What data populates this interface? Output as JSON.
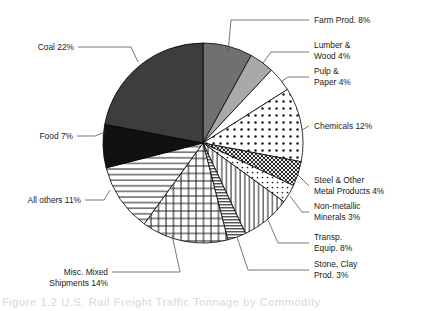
{
  "chart_data": {
    "type": "pie",
    "title": "",
    "xlabel": "",
    "ylabel": "",
    "legend_position": "callout-labels",
    "grid": false,
    "units": "percent",
    "total": 100,
    "categories": [
      "Farm Prod.",
      "Lumber & Wood",
      "Pulp & Paper",
      "Chemicals",
      "Steel & Other Metal Products",
      "Non-metallic Minerals",
      "Transp. Equip.",
      "Stone, Clay Prod.",
      "Misc. Mixed Shipments",
      "All others",
      "Food",
      "Coal"
    ],
    "values": [
      8,
      4,
      4,
      12,
      4,
      3,
      8,
      3,
      14,
      11,
      7,
      22
    ],
    "slices": [
      {
        "name": "farm-prod",
        "label_lines": [
          "Farm Prod. 8%"
        ],
        "value": 8,
        "percent_text": "8%",
        "fill": "#707070",
        "pattern": "solid",
        "start_angle": 0,
        "end_angle": 28.8
      },
      {
        "name": "lumber-wood",
        "label_lines": [
          "Lumber &",
          "Wood 4%"
        ],
        "value": 4,
        "percent_text": "4%",
        "fill": "#a9a9a9",
        "pattern": "solid",
        "start_angle": 28.8,
        "end_angle": 43.2
      },
      {
        "name": "pulp-paper",
        "label_lines": [
          "Pulp &",
          "Paper 4%"
        ],
        "value": 4,
        "percent_text": "4%",
        "fill": "#ffffff",
        "pattern": "none",
        "start_angle": 43.2,
        "end_angle": 57.6
      },
      {
        "name": "chemicals",
        "label_lines": [
          "Chemicals 12%"
        ],
        "value": 12,
        "percent_text": "12%",
        "fill": "#ffffff",
        "pattern": "dots",
        "start_angle": 57.6,
        "end_angle": 100.8
      },
      {
        "name": "steel-other-metal-products",
        "label_lines": [
          "Steel & Other",
          "Metal Products 4%"
        ],
        "value": 4,
        "percent_text": "4%",
        "fill": "#3a3a3a",
        "pattern": "dense-crosshatch",
        "start_angle": 100.8,
        "end_angle": 115.2
      },
      {
        "name": "non-metallic-minerals",
        "label_lines": [
          "Non-metallic",
          "Minerals 3%"
        ],
        "value": 3,
        "percent_text": "3%",
        "fill": "#ffffff",
        "pattern": "sparse-dots",
        "start_angle": 115.2,
        "end_angle": 126.0
      },
      {
        "name": "transp-equip",
        "label_lines": [
          "Transp.",
          "Equip. 8%"
        ],
        "value": 8,
        "percent_text": "8%",
        "fill": "#ffffff",
        "pattern": "vertical-lines",
        "start_angle": 126.0,
        "end_angle": 154.8
      },
      {
        "name": "stone-clay-prod",
        "label_lines": [
          "Stone, Clay",
          "Prod. 3%"
        ],
        "value": 3,
        "percent_text": "3%",
        "fill": "#ffffff",
        "pattern": "dense-horizontal",
        "start_angle": 154.8,
        "end_angle": 165.6
      },
      {
        "name": "misc-mixed-shipments",
        "label_lines": [
          "Misc. Mixed",
          "Shipments 14%"
        ],
        "value": 14,
        "percent_text": "14%",
        "fill": "#ffffff",
        "pattern": "grid",
        "start_angle": 165.6,
        "end_angle": 216.0
      },
      {
        "name": "all-others",
        "label_lines": [
          "All others 11%"
        ],
        "value": 11,
        "percent_text": "11%",
        "fill": "#ffffff",
        "pattern": "horizontal-lines",
        "start_angle": 216.0,
        "end_angle": 255.6
      },
      {
        "name": "food",
        "label_lines": [
          "Food 7%"
        ],
        "value": 7,
        "percent_text": "7%",
        "fill": "#111111",
        "pattern": "solid",
        "start_angle": 255.6,
        "end_angle": 280.8
      },
      {
        "name": "coal",
        "label_lines": [
          "Coal 22%"
        ],
        "value": 22,
        "percent_text": "22%",
        "fill": "#3d3d3d",
        "pattern": "solid",
        "start_angle": 280.8,
        "end_angle": 360.0
      }
    ]
  },
  "labels": {
    "farm_prod": "Farm Prod. 8%",
    "lumber_1": "Lumber &",
    "lumber_2": "Wood 4%",
    "pulp_1": "Pulp &",
    "pulp_2": "Paper 4%",
    "chemicals": "Chemicals 12%",
    "steel_1": "Steel & Other",
    "steel_2": "Metal Products 4%",
    "nonmetallic_1": "Non-metallic",
    "nonmetallic_2": "Minerals 3%",
    "transp_1": "Transp.",
    "transp_2": "Equip. 8%",
    "stone_1": "Stone, Clay",
    "stone_2": "Prod. 3%",
    "misc_1": "Misc. Mixed",
    "misc_2": "Shipments 14%",
    "all_others": "All others 11%",
    "food": "Food 7%",
    "coal": "Coal 22%"
  },
  "footer": {
    "cropped_caption": "Figure 1.2  U.S. Rail Freight Traffic Tonnage by Commodity"
  }
}
